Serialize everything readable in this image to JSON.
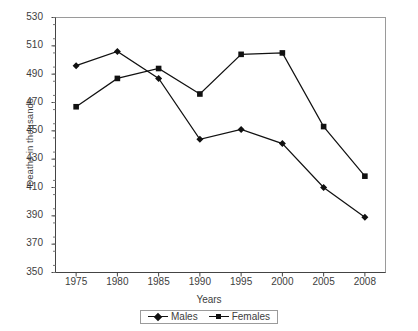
{
  "chart_data": {
    "type": "line",
    "title": "",
    "xlabel": "Years",
    "ylabel": "Deaths in thousands",
    "categories": [
      "1975",
      "1980",
      "1985",
      "1990",
      "1995",
      "2000",
      "2005",
      "2008"
    ],
    "series": [
      {
        "name": "Males",
        "marker": "diamond",
        "color": "#111111",
        "values": [
          496,
          506,
          487,
          444,
          451,
          441,
          410,
          389
        ]
      },
      {
        "name": "Females",
        "marker": "square",
        "color": "#111111",
        "values": [
          467,
          487,
          494,
          476,
          504,
          505,
          453,
          418
        ]
      }
    ],
    "ylim": [
      350,
      530
    ],
    "ytick_step": 20,
    "yticks": [
      350,
      370,
      390,
      410,
      430,
      450,
      470,
      490,
      510,
      530
    ],
    "ytick_labels": [
      "350",
      "370",
      "390",
      "410",
      "430",
      "450",
      "470",
      "490",
      "510",
      "530"
    ],
    "minor_ticks": true,
    "minor_tick_step": 5,
    "grid": false,
    "legend_position": "bottom-center",
    "plot_border_color": "#8c8c8c",
    "axis_color": "#4a4a4a"
  },
  "legend": {
    "entries": [
      {
        "label": "Males"
      },
      {
        "label": "Females"
      }
    ]
  }
}
